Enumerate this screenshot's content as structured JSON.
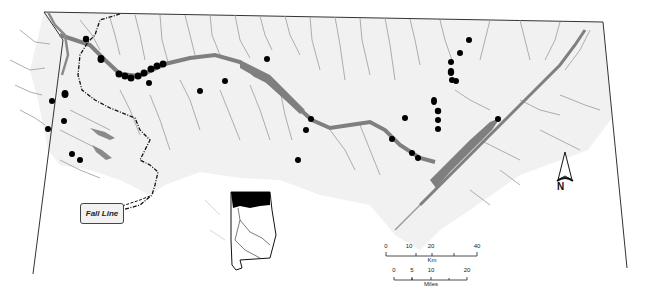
{
  "map": {
    "title": "North Alabama river basin sample site map",
    "region": "Tennessee River drainage, northern Alabama",
    "colors": {
      "background": "#ffffff",
      "land_shade": "#f1f1f1",
      "rivers": "#9a9a9a",
      "reservoirs": "#7f7f7f",
      "boundary": "#333333",
      "sites": "#000000",
      "fall_line": "#111111"
    },
    "legend": {
      "fall_line_label": "Fall Line"
    },
    "north_arrow": {
      "label": "N"
    },
    "scale_bars": [
      {
        "unit": "Km",
        "ticks": [
          "0",
          "10",
          "20",
          "40"
        ]
      },
      {
        "unit": "Miles",
        "ticks": [
          "0",
          "5",
          "10",
          "20"
        ]
      }
    ],
    "inset": {
      "description": "Alabama state outline with study area highlighted in black"
    },
    "sample_sites": [
      {
        "x": 86,
        "y": 39
      },
      {
        "x": 101,
        "y": 59
      },
      {
        "x": 119,
        "y": 74
      },
      {
        "x": 125,
        "y": 76
      },
      {
        "x": 131,
        "y": 78
      },
      {
        "x": 138,
        "y": 76
      },
      {
        "x": 144,
        "y": 73
      },
      {
        "x": 151,
        "y": 69
      },
      {
        "x": 157,
        "y": 66
      },
      {
        "x": 163,
        "y": 64
      },
      {
        "x": 149,
        "y": 83
      },
      {
        "x": 200,
        "y": 91
      },
      {
        "x": 225,
        "y": 81
      },
      {
        "x": 267,
        "y": 59
      },
      {
        "x": 66,
        "y": 93
      },
      {
        "x": 63,
        "y": 96
      },
      {
        "x": 52,
        "y": 101
      },
      {
        "x": 64,
        "y": 121
      },
      {
        "x": 48,
        "y": 129
      },
      {
        "x": 72,
        "y": 154
      },
      {
        "x": 80,
        "y": 160
      },
      {
        "x": 311,
        "y": 119
      },
      {
        "x": 306,
        "y": 130
      },
      {
        "x": 298,
        "y": 160
      },
      {
        "x": 405,
        "y": 118
      },
      {
        "x": 392,
        "y": 139
      },
      {
        "x": 412,
        "y": 153
      },
      {
        "x": 418,
        "y": 158
      },
      {
        "x": 469,
        "y": 40
      },
      {
        "x": 460,
        "y": 53
      },
      {
        "x": 451,
        "y": 62
      },
      {
        "x": 451,
        "y": 72
      },
      {
        "x": 452,
        "y": 80
      },
      {
        "x": 456,
        "y": 81
      },
      {
        "x": 434,
        "y": 100
      },
      {
        "x": 435,
        "y": 104
      },
      {
        "x": 438,
        "y": 111
      },
      {
        "x": 438,
        "y": 120
      },
      {
        "x": 438,
        "y": 129
      },
      {
        "x": 498,
        "y": 119
      }
    ]
  }
}
